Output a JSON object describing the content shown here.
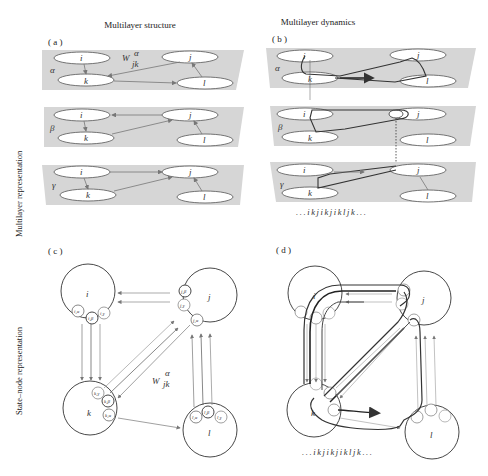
{
  "columns": {
    "left_title": "Multilayer structure",
    "right_title": "Multilayer dynamics"
  },
  "rows": {
    "top_label": "Multilayer representation",
    "bottom_label": "State–node representation"
  },
  "panels": {
    "a": {
      "label": "( a )"
    },
    "b": {
      "label": "( b )"
    },
    "c": {
      "label": "( c )"
    },
    "d": {
      "label": "( d )"
    }
  },
  "layers": [
    "α",
    "β",
    "γ"
  ],
  "nodes": [
    "i",
    "j",
    "k",
    "l"
  ],
  "weight_label": {
    "symbol": "W",
    "superscript": "α",
    "subscript": "jk"
  },
  "state_nodes": {
    "i": [
      "i,α",
      "i,β",
      "i,γ"
    ],
    "j": [
      "j,β",
      "j,γ",
      "j,α"
    ],
    "k": [
      "k,γ",
      "k,β",
      "k,α"
    ],
    "l": [
      "l,α",
      "l,β",
      "l,γ"
    ]
  },
  "sequences": {
    "b": "...ikjikjikljk...",
    "d": "...ikjikjikljk..."
  },
  "colors": {
    "plane": "#d6d6d6",
    "edge": "#777777",
    "path": "#333333"
  }
}
